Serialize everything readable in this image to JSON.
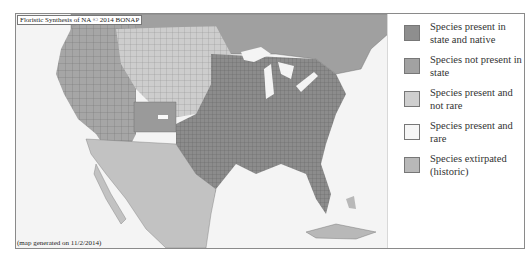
{
  "map": {
    "credit": "Floristic Synthesis of NA © 2014 BONAP",
    "generated": "(map generated on 11/2/2014)",
    "colors": {
      "water": "#f4f4f4",
      "present_native": "#8c8c8c",
      "not_present": "#a6a6a6",
      "present_not_rare": "#cdcdcd",
      "present_rare": "#f2f2f2",
      "extirpated": "#b4b4b4",
      "mexico": "#c2c2c2",
      "county_lines": "#555555"
    }
  },
  "legend": {
    "items": [
      {
        "label": "Species present in state and native",
        "color": "#8e8e8e"
      },
      {
        "label": "Species not present in state",
        "color": "#a2a2a2"
      },
      {
        "label": "Species present and not rare",
        "color": "#cfcfcf"
      },
      {
        "label": "Species present and rare",
        "color": "#f6f6f6"
      },
      {
        "label": "Species extirpated (historic)",
        "color": "#b8b8b8"
      }
    ]
  }
}
